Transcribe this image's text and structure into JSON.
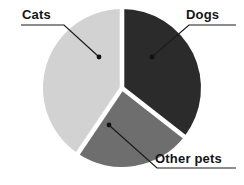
{
  "chart_data": {
    "type": "pie",
    "title": "",
    "subtitle": "",
    "xlabel": "",
    "ylabel": "",
    "legend_position": "none",
    "grid": false,
    "labels_position": "outside-with-leader-lines",
    "categories": [
      "Dogs",
      "Other pets",
      "Cats"
    ],
    "values": [
      35.6,
      23.9,
      40.5
    ],
    "units": "percent",
    "slices": [
      {
        "label": "Dogs",
        "value": 35.6,
        "color": "#2b2b2b",
        "start_angle_deg": 0,
        "end_angle_deg": 128
      },
      {
        "label": "Other pets",
        "value": 23.9,
        "color": "#6e6e6e",
        "start_angle_deg": 128,
        "end_angle_deg": 214
      },
      {
        "label": "Cats",
        "value": 40.5,
        "color": "#d2d2d2",
        "start_angle_deg": 214,
        "end_angle_deg": 360
      }
    ],
    "colors": {
      "dogs": "#2b2b2b",
      "other_pets": "#6e6e6e",
      "cats": "#d2d2d2",
      "background": "#ffffff",
      "leader_line": "#1a1a1a",
      "label_text": "#141414",
      "slice_gap": "#ffffff"
    },
    "geometry": {
      "center_x": 122,
      "center_y": 88,
      "radius": 79,
      "gap_width": 4
    }
  },
  "labels": {
    "cats": "Cats",
    "dogs": "Dogs",
    "other_pets": "Other pets"
  }
}
